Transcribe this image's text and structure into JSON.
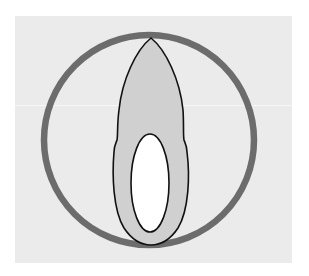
{
  "diagram": {
    "type": "schematic-illustration",
    "colors": {
      "page_bg": "#ffffff",
      "panel_bg": "#ebebeb",
      "circle_stroke": "#6c6c6c",
      "outer_shape_fill": "#d0d0d0",
      "outer_shape_stroke": "#111111",
      "inner_oval_fill": "#ffffff",
      "inner_oval_stroke": "#111111",
      "scan_line": "#f8f8f8"
    },
    "elements": [
      {
        "name": "background-panel",
        "x": 15,
        "y": 16,
        "width": 277,
        "height": 247
      },
      {
        "name": "outer-circle",
        "cx": 149,
        "cy": 140,
        "r": 105,
        "stroke_width": 6
      },
      {
        "name": "flame-shape",
        "top": [
          151,
          38
        ],
        "bottom": [
          151,
          245
        ],
        "max_width": 75
      },
      {
        "name": "inner-oval",
        "cx": 150,
        "cy": 183,
        "rx": 19,
        "ry": 49
      }
    ]
  }
}
